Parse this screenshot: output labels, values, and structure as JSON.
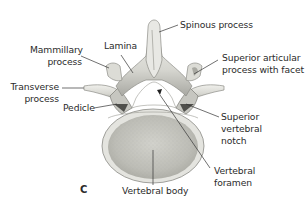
{
  "figure": {
    "panel_letter": "C",
    "labels": {
      "spinous_process": "Spinous process",
      "lamina": "Lamina",
      "mammillary_process": [
        "Mammillary",
        "process"
      ],
      "superior_articular_process": [
        "Superior articular",
        "process with facet"
      ],
      "transverse_process": [
        "Transverse",
        "process"
      ],
      "pedicle": "Pedicle",
      "superior_vertebral_notch": [
        "Superior",
        "vertebral",
        "notch"
      ],
      "vertebral_foramen": [
        "Vertebral",
        "foramen"
      ],
      "vertebral_body": "Vertebral body"
    },
    "colors": {
      "text": "#2b2b2b",
      "leader_line": "#333333",
      "bone_light": "#e9e9e6",
      "bone_mid": "#c9c9c4",
      "bone_dark": "#8c8c86",
      "body_fill": "#c8c8c2",
      "background": "#ffffff"
    }
  }
}
